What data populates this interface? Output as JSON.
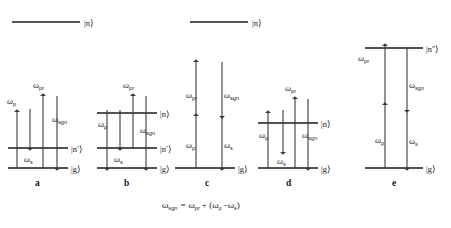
{
  "figure": {
    "background_color": "#ffffff",
    "line_color": "#1a1a1a",
    "arrow_color": "#3a3a3a",
    "equation": {
      "omega_sgn": "ω",
      "sub_sgn": "sgn",
      "equals": "=",
      "omega_pr": "ω",
      "sub_pr": "pr",
      "plus_open": "+ (",
      "omega_p": "ω",
      "sub_p": "p",
      "minus": "−",
      "omega_s": "ω",
      "sub_s": "s",
      "close": ")",
      "full_text": "ωsgn = ωpr + (ωp − ωs)"
    },
    "top_levels": [
      {
        "label_ket": "|n⟩",
        "base": "n",
        "prime": ""
      },
      {
        "label_ket": "|n⟩",
        "base": "n",
        "prime": ""
      }
    ],
    "panels": [
      {
        "letter": "a",
        "levels": [
          {
            "ket": "|n′⟩",
            "base": "n",
            "prime": "′"
          },
          {
            "ket": "|g⟩",
            "base": "g",
            "prime": ""
          }
        ],
        "arrows": [
          {
            "label": "ω",
            "sub": "p",
            "direction": "up"
          },
          {
            "label": "ω",
            "sub": "s",
            "direction": "down"
          },
          {
            "label": "ω",
            "sub": "pr",
            "direction": "up"
          },
          {
            "label": "ω",
            "sub": "sgn",
            "direction": "down"
          }
        ]
      },
      {
        "letter": "b",
        "levels": [
          {
            "ket": "|n⟩",
            "base": "n",
            "prime": ""
          },
          {
            "ket": "|n′⟩",
            "base": "n",
            "prime": "′"
          },
          {
            "ket": "|g⟩",
            "base": "g",
            "prime": ""
          }
        ],
        "arrows": [
          {
            "label": "ω",
            "sub": "p",
            "direction": "down"
          },
          {
            "label": "ω",
            "sub": "s",
            "direction": "down"
          },
          {
            "label": "ω",
            "sub": "pr",
            "direction": "up"
          },
          {
            "label": "ω",
            "sub": "sgn",
            "direction": "down"
          }
        ]
      },
      {
        "letter": "c",
        "levels": [
          {
            "ket": "|g⟩",
            "base": "g",
            "prime": ""
          }
        ],
        "arrows": [
          {
            "label": "ω",
            "sub": "pr",
            "direction": "up"
          },
          {
            "label": "ω",
            "sub": "sgn",
            "direction": "down"
          },
          {
            "label": "ω",
            "sub": "p",
            "direction": "up"
          },
          {
            "label": "ω",
            "sub": "s",
            "direction": "down"
          }
        ]
      },
      {
        "letter": "d",
        "levels": [
          {
            "ket": "|n⟩",
            "base": "n",
            "prime": ""
          },
          {
            "ket": "|g⟩",
            "base": "g",
            "prime": ""
          }
        ],
        "arrows": [
          {
            "label": "ω",
            "sub": "p",
            "direction": "up"
          },
          {
            "label": "ω",
            "sub": "s",
            "direction": "down"
          },
          {
            "label": "ω",
            "sub": "pr",
            "direction": "up"
          },
          {
            "label": "ω",
            "sub": "sgn",
            "direction": "down"
          }
        ]
      },
      {
        "letter": "e",
        "levels": [
          {
            "ket": "|n″⟩",
            "base": "n",
            "prime": "″"
          },
          {
            "ket": "|g⟩",
            "base": "g",
            "prime": ""
          }
        ],
        "arrows": [
          {
            "label": "ω",
            "sub": "pr",
            "direction": "up"
          },
          {
            "label": "ω",
            "sub": "sgn",
            "direction": "down"
          },
          {
            "label": "ω",
            "sub": "p",
            "direction": "up"
          },
          {
            "label": "ω",
            "sub": "s",
            "direction": "down"
          }
        ]
      }
    ]
  }
}
